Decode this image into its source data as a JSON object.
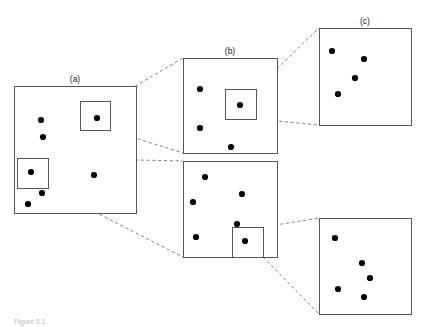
{
  "figure": {
    "caption": "Figure 5.1",
    "background_color": "#ffffff",
    "box_stroke_color": "#555555",
    "dot_color": "#000000",
    "connector_color": "#4a4a4a",
    "connector_style": "dashed",
    "label_color": "#1a1a1a"
  },
  "labels": [
    {
      "text": "(a)",
      "x": 75,
      "y": 82
    },
    {
      "text": "(b)",
      "x": 230,
      "y": 54
    },
    {
      "text": "(c)",
      "x": 365,
      "y": 24
    }
  ],
  "panels": [
    {
      "id": "panel-a",
      "label": "(a)",
      "box": {
        "x": 14,
        "y": 86,
        "width": 122,
        "height": 127
      },
      "dots": [
        {
          "x": 41,
          "y": 120
        },
        {
          "x": 43,
          "y": 137
        },
        {
          "x": 31,
          "y": 172
        },
        {
          "x": 42,
          "y": 193
        },
        {
          "x": 28,
          "y": 204
        },
        {
          "x": 94,
          "y": 175
        },
        {
          "x": 97,
          "y": 118
        }
      ],
      "inset_boxes": [
        {
          "id": "inset-a-top",
          "x": 80,
          "y": 101,
          "width": 30,
          "height": 29
        },
        {
          "id": "inset-a-bottom",
          "x": 17,
          "y": 158,
          "width": 31,
          "height": 30
        }
      ]
    },
    {
      "id": "panel-b-top",
      "label": "(b)",
      "box": {
        "x": 183,
        "y": 58,
        "width": 94,
        "height": 95
      },
      "dots": [
        {
          "x": 200,
          "y": 89
        },
        {
          "x": 200,
          "y": 128
        },
        {
          "x": 231,
          "y": 147
        },
        {
          "x": 240,
          "y": 105
        }
      ],
      "inset_boxes": [
        {
          "id": "inset-b-top",
          "x": 225,
          "y": 89,
          "width": 31,
          "height": 30
        }
      ]
    },
    {
      "id": "panel-b-bottom",
      "label": "",
      "box": {
        "x": 183,
        "y": 161,
        "width": 94,
        "height": 96
      },
      "dots": [
        {
          "x": 205,
          "y": 177
        },
        {
          "x": 193,
          "y": 202
        },
        {
          "x": 242,
          "y": 194
        },
        {
          "x": 196,
          "y": 237
        },
        {
          "x": 237,
          "y": 224
        },
        {
          "x": 245,
          "y": 241
        }
      ],
      "inset_boxes": [
        {
          "id": "inset-b-bottom",
          "x": 232,
          "y": 227,
          "width": 31,
          "height": 30
        }
      ]
    },
    {
      "id": "panel-c-top",
      "label": "(c)",
      "box": {
        "x": 319,
        "y": 28,
        "width": 92,
        "height": 97
      },
      "dots": [
        {
          "x": 332,
          "y": 51
        },
        {
          "x": 364,
          "y": 59
        },
        {
          "x": 355,
          "y": 78
        },
        {
          "x": 338,
          "y": 94
        }
      ],
      "inset_boxes": []
    },
    {
      "id": "panel-c-bottom",
      "label": "",
      "box": {
        "x": 319,
        "y": 218,
        "width": 92,
        "height": 96
      },
      "dots": [
        {
          "x": 335,
          "y": 238
        },
        {
          "x": 362,
          "y": 263
        },
        {
          "x": 370,
          "y": 278
        },
        {
          "x": 338,
          "y": 289
        },
        {
          "x": 364,
          "y": 297
        }
      ],
      "inset_boxes": []
    }
  ],
  "connectors": [
    {
      "id": "conn-a-top-to-b1-topleft",
      "x1": 110,
      "y1": 101,
      "x2": 183,
      "y2": 58
    },
    {
      "id": "conn-a-top-to-b1-bottomleft",
      "x1": 110,
      "y1": 130,
      "x2": 183,
      "y2": 153
    },
    {
      "id": "conn-a-bottom-to-b2-topleft",
      "x1": 48,
      "y1": 158,
      "x2": 183,
      "y2": 161
    },
    {
      "id": "conn-a-bottom-to-b2-bottomleft",
      "x1": 48,
      "y1": 188,
      "x2": 183,
      "y2": 257
    },
    {
      "id": "conn-b1-to-c1-topleft",
      "x1": 256,
      "y1": 89,
      "x2": 319,
      "y2": 28
    },
    {
      "id": "conn-b1-to-c1-bottomleft",
      "x1": 256,
      "y1": 119,
      "x2": 319,
      "y2": 125
    },
    {
      "id": "conn-b2-to-c2-topleft",
      "x1": 263,
      "y1": 227,
      "x2": 319,
      "y2": 218
    },
    {
      "id": "conn-b2-to-c2-bottomleft",
      "x1": 263,
      "y1": 257,
      "x2": 319,
      "y2": 314
    }
  ],
  "dot_radius": 3.1
}
